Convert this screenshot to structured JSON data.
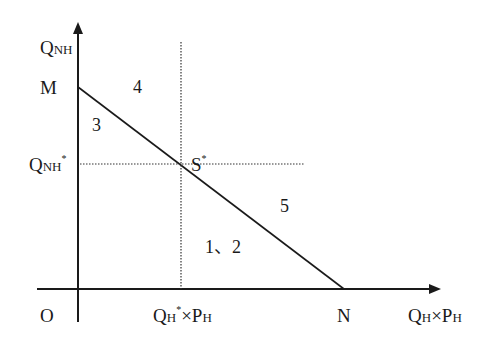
{
  "diagram": {
    "y_axis": {
      "label_main": "Q",
      "label_sub": "NH"
    },
    "x_axis": {
      "label_q": "Q",
      "label_q_sub": "H",
      "label_times": "×",
      "label_p": "P",
      "label_p_sub": "H"
    },
    "origin": "O",
    "point_M": "M",
    "point_N": "N",
    "point_S": {
      "main": "S",
      "sup": "*"
    },
    "y_tick": {
      "main": "Q",
      "sub": "NH",
      "sup": "*"
    },
    "x_tick": {
      "q": "Q",
      "q_sub": "H",
      "sup": "*",
      "times": "×",
      "p": "P",
      "p_sub": "H"
    },
    "regions": [
      {
        "id": "3",
        "label": "3"
      },
      {
        "id": "4",
        "label": "4"
      },
      {
        "id": "5",
        "label": "5"
      },
      {
        "id": "1-2",
        "label": "1、2"
      }
    ],
    "colors": {
      "line": "#1a1a1a",
      "background": "#ffffff"
    }
  }
}
